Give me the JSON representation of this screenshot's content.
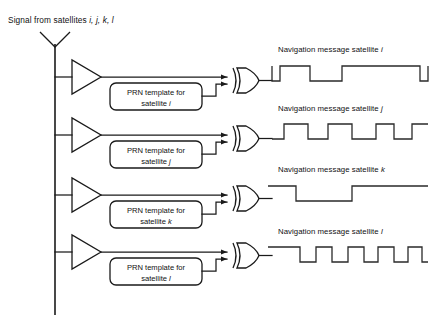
{
  "diagram": {
    "header": {
      "prefix": "Signal from satellites ",
      "satellites": "i, j, k, l",
      "full": "Signal from satellites i, j, k, l"
    },
    "colors": {
      "line": "#1a1a1a",
      "waveform": "#2a2a2a",
      "text": "#111111",
      "background": "#ffffff"
    },
    "antenna": {
      "name": "receiving antenna",
      "bus_label": ""
    },
    "channels": [
      {
        "id": "i",
        "amplifier_label": "",
        "prn_line1": "PRN template for",
        "prn_line2_prefix": "satellite ",
        "prn_line2_sat": "i",
        "gate_type": "XOR",
        "output_label_prefix": "Navigation message satellite ",
        "output_label_sat": "i",
        "output_label_full": "Navigation message satellite i",
        "waveform": {
          "levels": [
            1,
            0,
            1,
            0,
            1
          ],
          "transitions_x": [
            0,
            8,
            38,
            70,
            148,
            156
          ],
          "bit_rate": "lowest"
        }
      },
      {
        "id": "j",
        "amplifier_label": "",
        "prn_line1": "PRN template for",
        "prn_line2_prefix": "satellite ",
        "prn_line2_sat": "j",
        "gate_type": "XOR",
        "output_label_prefix": "Navigation message satellite ",
        "output_label_sat": "j",
        "output_label_full": "Navigation message satellite j",
        "waveform": {
          "levels": [
            0,
            1,
            0,
            1,
            0,
            1,
            0,
            1
          ],
          "transitions_x": [
            0,
            12,
            36,
            56,
            80,
            104,
            122,
            140,
            156
          ],
          "bit_rate": "medium"
        }
      },
      {
        "id": "k",
        "amplifier_label": "",
        "prn_line1": "PRN template for",
        "prn_line2_prefix": "satellite ",
        "prn_line2_sat": "k",
        "gate_type": "XOR",
        "output_label_prefix": "Navigation message satellite ",
        "output_label_sat": "k",
        "output_label_full": "Navigation message satellite k",
        "waveform": {
          "levels": [
            1,
            0,
            1
          ],
          "transitions_x": [
            0,
            24,
            80,
            156
          ],
          "bit_rate": "lowest"
        }
      },
      {
        "id": "l",
        "amplifier_label": "",
        "prn_line1": "PRN template for",
        "prn_line2_prefix": "satellite ",
        "prn_line2_sat": "l",
        "gate_type": "XOR",
        "output_label_prefix": "Navigation message satellite ",
        "output_label_sat": "l",
        "output_label_full": "Navigation message satellite l",
        "waveform": {
          "levels": [
            1,
            0,
            1,
            0,
            1,
            0,
            1,
            0,
            1,
            0,
            1
          ],
          "transitions_x": [
            0,
            28,
            44,
            60,
            76,
            92,
            106,
            122,
            136,
            150,
            156
          ],
          "bit_rate": "highest"
        }
      }
    ]
  }
}
